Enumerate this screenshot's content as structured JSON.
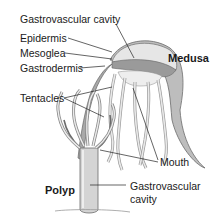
{
  "diagram": {
    "forms": [
      {
        "name": "Medusa"
      },
      {
        "name": "Polyp"
      }
    ],
    "labels": {
      "gastrovascular_cavity_top": "Gastrovascular cavity",
      "epidermis": "Epidermis",
      "mesoglea": "Mesoglea",
      "gastrodermis": "Gastrodermis",
      "tentacles": "Tentacles",
      "medusa": "Medusa",
      "mouth": "Mouth",
      "polyp": "Polyp",
      "gastrovascular_cavity_bottom_line1": "Gastrovascular",
      "gastrovascular_cavity_bottom_line2": "cavity"
    },
    "colors": {
      "outline": "#6b6b6b",
      "body_fill": "#d9d9d9",
      "dark_fill": "#9a9a9a",
      "leader_line": "#222222"
    }
  }
}
